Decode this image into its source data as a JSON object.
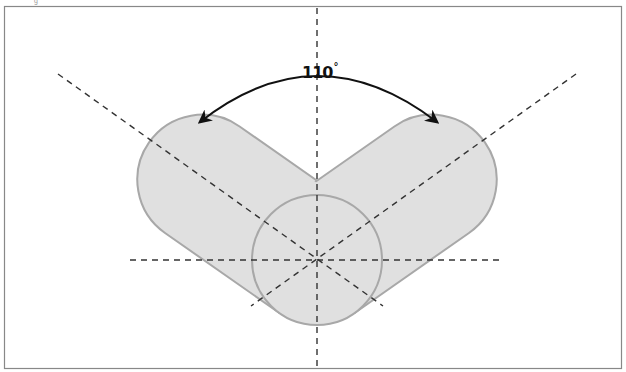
{
  "diagram": {
    "type": "angle-diagram",
    "angle_label": {
      "value": "110",
      "unit": "°"
    },
    "colors": {
      "frame": "#888888",
      "shape_fill": "#e0e0e0",
      "shape_stroke": "#a8a8a8",
      "dashed_lines": "#333333",
      "arrow": "#111111"
    },
    "geometry": {
      "center": [
        317,
        260
      ],
      "circle_radius": 65,
      "arm_half_width": 65,
      "arm_length": 140,
      "arm_angle_from_vertical_deg": 55
    },
    "stray_mark": "g"
  }
}
